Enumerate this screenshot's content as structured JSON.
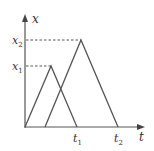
{
  "diagram": {
    "type": "position-time graph",
    "axes": {
      "y_label": "x",
      "x_label": "t"
    },
    "y_ticks": [
      {
        "base": "x",
        "sub": "2"
      },
      {
        "base": "x",
        "sub": "1"
      }
    ],
    "x_ticks": [
      {
        "base": "t",
        "sub": "1"
      },
      {
        "base": "t",
        "sub": "2"
      }
    ],
    "curves": [
      {
        "name": "triangle-1",
        "start": "0",
        "peak_level": "x1",
        "end": "t1"
      },
      {
        "name": "triangle-2",
        "start": "offset",
        "peak_level": "x2",
        "end": "t2"
      }
    ],
    "colors": {
      "line": "#555555",
      "dash": "#555555",
      "text": "#333333"
    }
  }
}
